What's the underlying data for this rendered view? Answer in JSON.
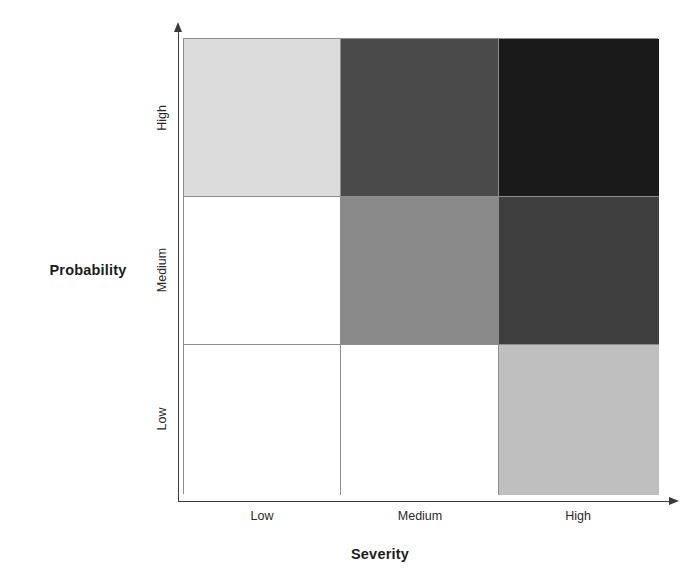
{
  "axes": {
    "y_title": "Probability",
    "x_title": "Severity",
    "y_ticks": [
      "High",
      "Medium",
      "Low"
    ],
    "x_ticks": [
      "Low",
      "Medium",
      "High"
    ]
  },
  "chart_data": {
    "type": "heatmap",
    "title": "",
    "subtitle": "",
    "xlabel": "Severity",
    "ylabel": "Probability",
    "x_categories": [
      "Low",
      "Medium",
      "High"
    ],
    "y_categories": [
      "High",
      "Medium",
      "Low"
    ],
    "grid": true,
    "legend": "none",
    "colormap": "grayscale",
    "cell_border_color": "#8d8d8d",
    "axis_color": "#3a3a3a",
    "cells": [
      {
        "row": "High",
        "col": "Low",
        "risk_level": "Low-Medium",
        "value": 2,
        "color": "#dcdcdc"
      },
      {
        "row": "High",
        "col": "Medium",
        "risk_level": "High",
        "value": 5,
        "color": "#4a4a4a"
      },
      {
        "row": "High",
        "col": "High",
        "risk_level": "Extreme",
        "value": 6,
        "color": "#1a1a1a"
      },
      {
        "row": "Medium",
        "col": "Low",
        "risk_level": "Negligible",
        "value": 0,
        "color": "#ffffff"
      },
      {
        "row": "Medium",
        "col": "Medium",
        "risk_level": "Medium",
        "value": 3,
        "color": "#8a8a8a"
      },
      {
        "row": "Medium",
        "col": "High",
        "risk_level": "High",
        "value": 5,
        "color": "#3f3f3f"
      },
      {
        "row": "Low",
        "col": "Low",
        "risk_level": "Negligible",
        "value": 0,
        "color": "#ffffff"
      },
      {
        "row": "Low",
        "col": "Medium",
        "risk_level": "Negligible",
        "value": 0,
        "color": "#ffffff"
      },
      {
        "row": "Low",
        "col": "High",
        "risk_level": "Medium-Low",
        "value": 2,
        "color": "#bfbfbf"
      }
    ],
    "matrix_colors": [
      [
        "#dcdcdc",
        "#4a4a4a",
        "#1a1a1a"
      ],
      [
        "#ffffff",
        "#8a8a8a",
        "#3f3f3f"
      ],
      [
        "#ffffff",
        "#ffffff",
        "#bfbfbf"
      ]
    ],
    "matrix_values": [
      [
        2,
        5,
        6
      ],
      [
        0,
        3,
        5
      ],
      [
        0,
        0,
        2
      ]
    ]
  }
}
